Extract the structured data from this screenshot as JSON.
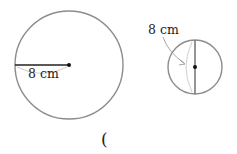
{
  "diagram": {
    "circle_a": {
      "label": "8 cm",
      "measure": "radius",
      "center": [
        69,
        65
      ],
      "r": 54
    },
    "circle_b": {
      "label": "8 cm",
      "measure": "diameter",
      "center": [
        195,
        67
      ],
      "r": 27
    },
    "answer_paren": "("
  },
  "colors": {
    "circle_stroke": "#8c8c8c",
    "line": "#222222",
    "arc": "#c8c8c8",
    "text": "#222222"
  }
}
